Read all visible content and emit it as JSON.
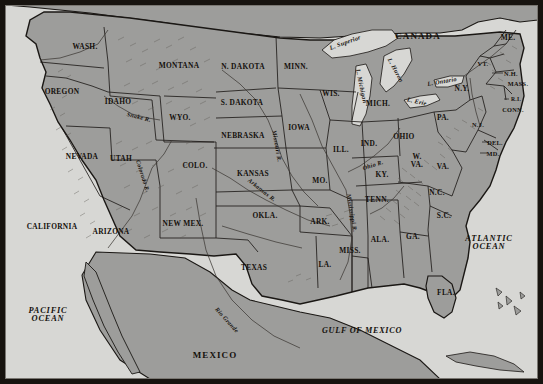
{
  "map": {
    "title": "Map of the United States",
    "colors": {
      "land": "#9d9d9b",
      "ocean": "#d7d7d4",
      "border_line": "#1a1714",
      "frame": "#17130f",
      "label_text": "#14100c",
      "lake_fill": "#dcdcd9",
      "relief": "#6a6762"
    },
    "frame": {
      "thickness_px": 5
    },
    "countries": [
      {
        "name": "CANADA",
        "x": 418,
        "y": 36
      },
      {
        "name": "MEXICO",
        "x": 215,
        "y": 355
      }
    ],
    "oceans": [
      {
        "name": "PACIFIC OCEAN",
        "lines": [
          "PACIFIC",
          "OCEAN"
        ],
        "x": 48,
        "y": 315
      },
      {
        "name": "ATLANTIC OCEAN",
        "lines": [
          "ATLANTIC",
          "OCEAN"
        ],
        "x": 489,
        "y": 243
      },
      {
        "name": "GULF OF MEXICO",
        "lines": [
          "GULF OF MEXICO"
        ],
        "x": 362,
        "y": 330
      }
    ],
    "lakes": [
      {
        "name": "L. Superior",
        "x": 345,
        "y": 42,
        "rotate": -20
      },
      {
        "name": "L. Michigan",
        "x": 362,
        "y": 86,
        "rotate": 78
      },
      {
        "name": "L. Huron",
        "x": 396,
        "y": 70,
        "rotate": 62
      },
      {
        "name": "L. Erie",
        "x": 417,
        "y": 101,
        "rotate": 12
      },
      {
        "name": "L. Ontario",
        "x": 442,
        "y": 81,
        "rotate": -10
      }
    ],
    "rivers": [
      {
        "name": "Snake R.",
        "x": 139,
        "y": 117,
        "rotate": 14
      },
      {
        "name": "Colorado R.",
        "x": 143,
        "y": 176,
        "rotate": 72
      },
      {
        "name": "Missouri R.",
        "x": 277,
        "y": 146,
        "rotate": 80
      },
      {
        "name": "Arkansas R.",
        "x": 262,
        "y": 190,
        "rotate": 38
      },
      {
        "name": "Mississippi R.",
        "x": 352,
        "y": 213,
        "rotate": 80
      },
      {
        "name": "Ohio R.",
        "x": 373,
        "y": 165,
        "rotate": -18
      },
      {
        "name": "Rio Grande",
        "x": 227,
        "y": 320,
        "rotate": 48
      }
    ],
    "states": [
      {
        "abbr": "WASH.",
        "x": 85,
        "y": 46,
        "size": "state"
      },
      {
        "abbr": "OREGON",
        "x": 62,
        "y": 91,
        "size": "state"
      },
      {
        "abbr": "IDAHO",
        "x": 118,
        "y": 101,
        "size": "state"
      },
      {
        "abbr": "MONTANA",
        "x": 179,
        "y": 65,
        "size": "state"
      },
      {
        "abbr": "WYO.",
        "x": 180,
        "y": 117,
        "size": "state"
      },
      {
        "abbr": "NEVADA",
        "x": 82,
        "y": 156,
        "size": "state"
      },
      {
        "abbr": "UTAH",
        "x": 121,
        "y": 158,
        "size": "state"
      },
      {
        "abbr": "CALIFORNIA",
        "x": 52,
        "y": 226,
        "size": "state"
      },
      {
        "abbr": "ARIZONA",
        "x": 111,
        "y": 231,
        "size": "state"
      },
      {
        "abbr": "COLO.",
        "x": 195,
        "y": 165,
        "size": "state"
      },
      {
        "abbr": "NEW MEX.",
        "x": 183,
        "y": 223,
        "size": "state"
      },
      {
        "abbr": "N. DAKOTA",
        "x": 243,
        "y": 66,
        "size": "state"
      },
      {
        "abbr": "S. DAKOTA",
        "x": 242,
        "y": 102,
        "size": "state"
      },
      {
        "abbr": "NEBRASKA",
        "x": 243,
        "y": 135,
        "size": "state"
      },
      {
        "abbr": "KANSAS",
        "x": 253,
        "y": 173,
        "size": "state"
      },
      {
        "abbr": "OKLA.",
        "x": 265,
        "y": 215,
        "size": "state"
      },
      {
        "abbr": "TEXAS",
        "x": 254,
        "y": 267,
        "size": "state"
      },
      {
        "abbr": "MINN.",
        "x": 296,
        "y": 66,
        "size": "state"
      },
      {
        "abbr": "IOWA",
        "x": 299,
        "y": 127,
        "size": "state"
      },
      {
        "abbr": "MO.",
        "x": 320,
        "y": 180,
        "size": "state"
      },
      {
        "abbr": "ARK.",
        "x": 320,
        "y": 221,
        "size": "state"
      },
      {
        "abbr": "LA.",
        "x": 325,
        "y": 264,
        "size": "state"
      },
      {
        "abbr": "WIS.",
        "x": 331,
        "y": 93,
        "size": "state"
      },
      {
        "abbr": "ILL.",
        "x": 341,
        "y": 149,
        "size": "state"
      },
      {
        "abbr": "MISS.",
        "x": 350,
        "y": 250,
        "size": "state"
      },
      {
        "abbr": "MICH.",
        "x": 378,
        "y": 103,
        "size": "state"
      },
      {
        "abbr": "IND.",
        "x": 369,
        "y": 143,
        "size": "state"
      },
      {
        "abbr": "KY.",
        "x": 382,
        "y": 174,
        "size": "state"
      },
      {
        "abbr": "TENN.",
        "x": 377,
        "y": 199,
        "size": "state"
      },
      {
        "abbr": "ALA.",
        "x": 380,
        "y": 239,
        "size": "state"
      },
      {
        "abbr": "GA.",
        "x": 413,
        "y": 236,
        "size": "state"
      },
      {
        "abbr": "FLA.",
        "x": 446,
        "y": 292,
        "size": "state"
      },
      {
        "abbr": "OHIO",
        "x": 404,
        "y": 136,
        "size": "state"
      },
      {
        "abbr": "W. VA.",
        "x": 417,
        "y": 161,
        "size": "state",
        "lines": [
          "W.",
          "VA."
        ]
      },
      {
        "abbr": "VA.",
        "x": 443,
        "y": 166,
        "size": "state"
      },
      {
        "abbr": "N.C.",
        "x": 437,
        "y": 192,
        "size": "state"
      },
      {
        "abbr": "S.C.",
        "x": 444,
        "y": 215,
        "size": "state"
      },
      {
        "abbr": "PA.",
        "x": 443,
        "y": 117,
        "size": "state"
      },
      {
        "abbr": "N.Y.",
        "x": 462,
        "y": 88,
        "size": "state"
      },
      {
        "abbr": "VT.",
        "x": 483,
        "y": 63,
        "size": "state",
        "sizecls": "sm"
      },
      {
        "abbr": "ME.",
        "x": 508,
        "y": 37,
        "size": "state"
      },
      {
        "abbr": "N.H.",
        "x": 511,
        "y": 73,
        "size": "state",
        "sizecls": "sm"
      },
      {
        "abbr": "MASS.",
        "x": 518,
        "y": 83,
        "size": "state",
        "sizecls": "sm"
      },
      {
        "abbr": "R.I.",
        "x": 516,
        "y": 99,
        "size": "state",
        "sizecls": "xs"
      },
      {
        "abbr": "CONN.",
        "x": 513,
        "y": 109,
        "size": "state",
        "sizecls": "sm"
      },
      {
        "abbr": "N.J.",
        "x": 478,
        "y": 124,
        "size": "state",
        "sizecls": "sm"
      },
      {
        "abbr": "DEL.",
        "x": 495,
        "y": 142,
        "size": "state",
        "sizecls": "sm"
      },
      {
        "abbr": "MD.",
        "x": 493,
        "y": 153,
        "size": "state",
        "sizecls": "sm"
      }
    ]
  }
}
